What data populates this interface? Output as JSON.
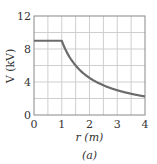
{
  "chart_data": {
    "type": "line",
    "title": "",
    "caption": "(a)",
    "xlabel": "r (m)",
    "ylabel": "V (kV)",
    "xlim": [
      0,
      4
    ],
    "ylim": [
      0,
      12
    ],
    "xticks": [
      "0",
      "1",
      "2",
      "3",
      "4"
    ],
    "yticks": [
      "0",
      "4",
      "8",
      "12"
    ],
    "grid": true,
    "grid_x_step": 0.5,
    "grid_y_step": 2,
    "legend": null,
    "series": [
      {
        "name": "V(r)",
        "color": "#6b6b6b",
        "x": [
          0,
          0.5,
          1.0,
          1.25,
          1.5,
          1.75,
          2.0,
          2.25,
          2.5,
          2.75,
          3.0,
          3.25,
          3.5,
          3.75,
          4.0
        ],
        "y": [
          9,
          9,
          9,
          7.2,
          6.0,
          5.14,
          4.5,
          4.0,
          3.6,
          3.27,
          3.0,
          2.77,
          2.57,
          2.4,
          2.25
        ]
      }
    ]
  }
}
